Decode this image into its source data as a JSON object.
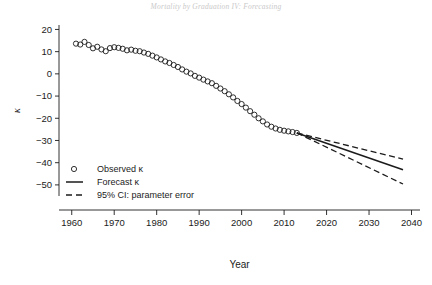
{
  "page": {
    "running_head": "Mortality by Graduation IV: Forecasting",
    "folio": ""
  },
  "chart_data": {
    "type": "scatter",
    "title": "",
    "xlabel": "Year",
    "ylabel": "κ",
    "xlim": [
      1957,
      2042
    ],
    "ylim": [
      -55,
      22
    ],
    "xticks": [
      1960,
      1970,
      1980,
      1990,
      2000,
      2010,
      2020,
      2030,
      2040
    ],
    "xtick_labels": [
      "1960",
      "1970",
      "1980",
      "1990",
      "2000",
      "2010",
      "2020",
      "2030",
      "2040"
    ],
    "yticks": [
      20,
      10,
      0,
      -10,
      -20,
      -30,
      -40,
      -50
    ],
    "ytick_labels": [
      "20",
      "10",
      "0",
      "−10",
      "−20",
      "−30",
      "−40",
      "−50"
    ],
    "grid": false,
    "legend_position": "lower-left",
    "series": [
      {
        "name": "Observed κ",
        "type": "scatter",
        "marker": "open-circle",
        "color": "#1b1b1b",
        "x": [
          1961,
          1962,
          1963,
          1964,
          1965,
          1966,
          1967,
          1968,
          1969,
          1970,
          1971,
          1972,
          1973,
          1974,
          1975,
          1976,
          1977,
          1978,
          1979,
          1980,
          1981,
          1982,
          1983,
          1984,
          1985,
          1986,
          1987,
          1988,
          1989,
          1990,
          1991,
          1992,
          1993,
          1994,
          1995,
          1996,
          1997,
          1998,
          1999,
          2000,
          2001,
          2002,
          2003,
          2004,
          2005,
          2006,
          2007,
          2008,
          2009,
          2010,
          2011,
          2012,
          2013
        ],
        "y": [
          13.6,
          13.2,
          14.4,
          13.0,
          11.5,
          12.2,
          11.0,
          10.2,
          11.6,
          12.0,
          11.7,
          11.3,
          10.6,
          10.9,
          10.4,
          10.2,
          9.6,
          9.0,
          8.2,
          7.4,
          6.5,
          5.6,
          4.9,
          4.0,
          3.1,
          2.0,
          1.0,
          0.2,
          -0.9,
          -1.7,
          -2.6,
          -3.4,
          -4.2,
          -5.4,
          -6.6,
          -7.8,
          -9.2,
          -10.6,
          -12.2,
          -13.6,
          -15.2,
          -16.8,
          -18.4,
          -20.0,
          -21.4,
          -22.8,
          -23.8,
          -24.6,
          -25.2,
          -25.6,
          -25.9,
          -26.2,
          -26.6
        ]
      },
      {
        "name": "Forecast κ",
        "type": "line",
        "style": "solid",
        "color": "#1b1b1b",
        "x": [
          2013,
          2038
        ],
        "y": [
          -26.6,
          -43.2
        ]
      },
      {
        "name": "95% CI: parameter error",
        "type": "line",
        "style": "dashed",
        "color": "#1b1b1b",
        "bounds": {
          "upper": {
            "x": [
              2013,
              2038
            ],
            "y": [
              -26.6,
              -38.4
            ]
          },
          "lower": {
            "x": [
              2013,
              2038
            ],
            "y": [
              -26.6,
              -49.6
            ]
          }
        }
      }
    ],
    "legend": [
      {
        "label": "Observed κ",
        "marker": "open-circle"
      },
      {
        "label": "Forecast κ",
        "marker": "solid-line"
      },
      {
        "label": "95% CI: parameter error",
        "marker": "dashed-line"
      }
    ]
  }
}
